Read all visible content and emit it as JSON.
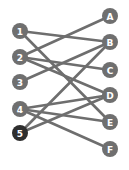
{
  "diagram": {
    "type": "bipartite-graph",
    "left_nodes": [
      {
        "id": "1",
        "label": "1",
        "x": 20,
        "y": 31,
        "highlighted": false
      },
      {
        "id": "2",
        "label": "2",
        "x": 20,
        "y": 57,
        "highlighted": false
      },
      {
        "id": "3",
        "label": "3",
        "x": 20,
        "y": 82,
        "highlighted": false
      },
      {
        "id": "4",
        "label": "4",
        "x": 20,
        "y": 109,
        "highlighted": false
      },
      {
        "id": "5",
        "label": "5",
        "x": 20,
        "y": 133,
        "highlighted": true
      }
    ],
    "right_nodes": [
      {
        "id": "A",
        "label": "A",
        "x": 110,
        "y": 16
      },
      {
        "id": "B",
        "label": "B",
        "x": 110,
        "y": 42
      },
      {
        "id": "C",
        "label": "C",
        "x": 110,
        "y": 70
      },
      {
        "id": "D",
        "label": "D",
        "x": 110,
        "y": 95
      },
      {
        "id": "E",
        "label": "E",
        "x": 110,
        "y": 122
      },
      {
        "id": "F",
        "label": "F",
        "x": 110,
        "y": 149
      }
    ],
    "edges": [
      {
        "from": "1",
        "to": "B"
      },
      {
        "from": "1",
        "to": "E"
      },
      {
        "from": "2",
        "to": "A"
      },
      {
        "from": "2",
        "to": "C"
      },
      {
        "from": "2",
        "to": "D"
      },
      {
        "from": "3",
        "to": "B"
      },
      {
        "from": "4",
        "to": "D"
      },
      {
        "from": "4",
        "to": "E"
      },
      {
        "from": "4",
        "to": "F"
      },
      {
        "from": "5",
        "to": "B"
      },
      {
        "from": "5",
        "to": "D"
      }
    ],
    "colors": {
      "node": "#6f6f6f",
      "node_highlighted": "#2e2e2e",
      "edge": "#6e6e6e",
      "label": "#ffffff",
      "background": "#ffffff"
    },
    "node_radius": 8
  }
}
